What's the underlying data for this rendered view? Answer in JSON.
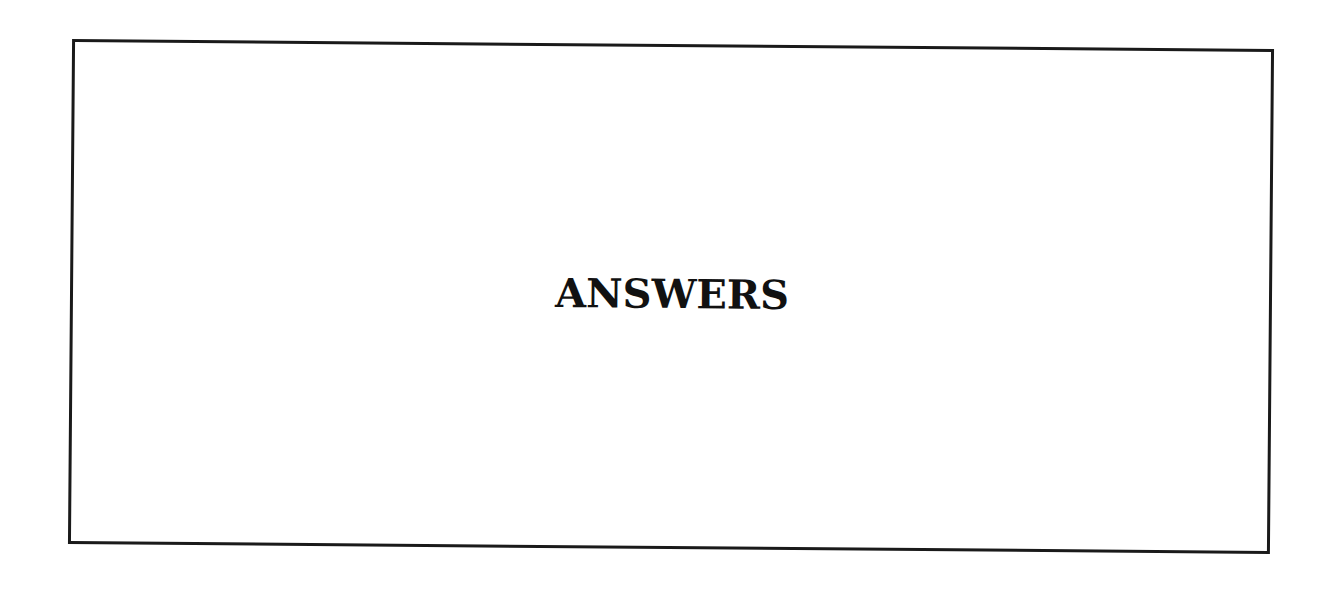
{
  "heading": {
    "title": "ANSWERS"
  },
  "colors": {
    "border": "#1a1a1a",
    "text": "#111111",
    "background": "#ffffff"
  }
}
